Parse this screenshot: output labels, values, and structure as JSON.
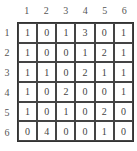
{
  "col_headers": [
    "1",
    "2",
    "3",
    "4",
    "5",
    "6"
  ],
  "row_headers": [
    "1",
    "2",
    "3",
    "4",
    "5",
    "6"
  ],
  "matrix": [
    [
      "1",
      "0",
      "1",
      "3",
      "0",
      "1"
    ],
    [
      "1",
      "0",
      "0",
      "1",
      "2",
      "1"
    ],
    [
      "1",
      "1",
      "0",
      "2",
      "1",
      "1"
    ],
    [
      "1",
      "0",
      "2",
      "0",
      "0",
      "1"
    ],
    [
      "1",
      "0",
      "1",
      "0",
      "2",
      "0"
    ],
    [
      "0",
      "4",
      "0",
      "0",
      "1",
      "0"
    ]
  ]
}
